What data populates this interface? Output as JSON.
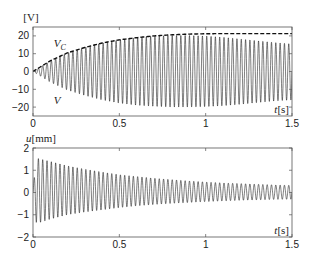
{
  "chart_data": [
    {
      "type": "line",
      "title": "",
      "ylabel": "[V]",
      "xlabel": "t[s]",
      "xlim": [
        0,
        1.5
      ],
      "ylim": [
        -25,
        25
      ],
      "xticks": [
        0,
        0.5,
        1,
        1.5
      ],
      "xtick_labels": [
        "0",
        "0.5",
        "1",
        "1.5"
      ],
      "yticks": [
        -20,
        -10,
        0,
        10,
        20
      ],
      "ytick_labels": [
        "−20",
        "−10",
        "0",
        "10",
        "20"
      ],
      "grid": false,
      "annotations": [
        {
          "text": "V",
          "subscript": "C",
          "x": 0.12,
          "y": 14
        },
        {
          "text": "V",
          "subscript": "",
          "x": 0.12,
          "y": -18
        }
      ],
      "series": [
        {
          "name": "V_C",
          "style": "dashed",
          "x": [
            0,
            0.1,
            0.2,
            0.3,
            0.4,
            0.5,
            0.6,
            0.7,
            0.8,
            0.9,
            1.0,
            1.1,
            1.2,
            1.3,
            1.4,
            1.5
          ],
          "values": [
            0,
            6,
            10.5,
            13.5,
            16,
            17.8,
            19,
            20,
            20.6,
            21,
            21.2,
            21.3,
            21.3,
            21.3,
            21.3,
            21.3
          ]
        },
        {
          "name": "V",
          "style": "solid-oscillating",
          "oscillation_frequency_hz": 40,
          "x": [
            0,
            0.1,
            0.2,
            0.3,
            0.4,
            0.5,
            0.6,
            0.7,
            0.8,
            0.9,
            1.0,
            1.1,
            1.2,
            1.3,
            1.4,
            1.5
          ],
          "envelope_upper": [
            0,
            6,
            10.5,
            13.5,
            16,
            17.8,
            19,
            20,
            20.3,
            20.3,
            20,
            19.3,
            18.3,
            17.3,
            16.3,
            15.5
          ],
          "envelope_lower": [
            0,
            -6,
            -10.5,
            -13.5,
            -16,
            -17.8,
            -19,
            -19.6,
            -20,
            -20,
            -19.8,
            -19.3,
            -18.5,
            -17.5,
            -16.6,
            -16
          ]
        }
      ]
    },
    {
      "type": "line",
      "title": "",
      "ylabel": "u[mm]",
      "xlabel": "t[s]",
      "xlim": [
        0,
        1.5
      ],
      "ylim": [
        -2,
        2
      ],
      "xticks": [
        0,
        0.5,
        1,
        1.5
      ],
      "xtick_labels": [
        "0",
        "0.5",
        "1",
        "1.5"
      ],
      "yticks": [
        -2,
        -1,
        0,
        1,
        2
      ],
      "ytick_labels": [
        "−2",
        "−1",
        "0",
        "1",
        "2"
      ],
      "grid": false,
      "series": [
        {
          "name": "u",
          "style": "solid-oscillating",
          "oscillation_frequency_hz": 40,
          "x": [
            0,
            0.02,
            0.1,
            0.2,
            0.3,
            0.4,
            0.5,
            0.6,
            0.7,
            0.8,
            0.9,
            1.0,
            1.1,
            1.2,
            1.3,
            1.4,
            1.5
          ],
          "envelope_upper": [
            0.2,
            1.55,
            1.4,
            1.2,
            1.05,
            0.92,
            0.8,
            0.72,
            0.64,
            0.58,
            0.52,
            0.47,
            0.43,
            0.4,
            0.37,
            0.34,
            0.32
          ],
          "envelope_lower": [
            -0.2,
            -1.4,
            -1.2,
            -1.0,
            -0.88,
            -0.78,
            -0.68,
            -0.6,
            -0.54,
            -0.49,
            -0.45,
            -0.41,
            -0.38,
            -0.35,
            -0.33,
            -0.31,
            -0.3
          ]
        }
      ]
    }
  ],
  "figure": {
    "panels": [
      {
        "box": {
          "left": 33,
          "top": 27,
          "right": 292,
          "bottom": 116
        }
      },
      {
        "box": {
          "left": 33,
          "top": 148,
          "right": 292,
          "bottom": 237
        }
      }
    ],
    "colors": {
      "line": "#111111",
      "axes": "#555555",
      "text": "#222222"
    }
  }
}
